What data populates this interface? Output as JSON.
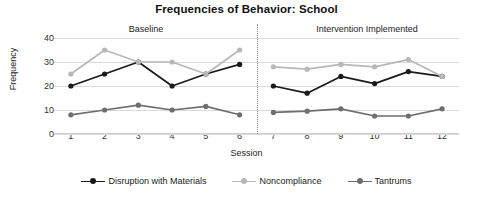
{
  "chart_data": {
    "type": "line",
    "title": "Frequencies of Behavior: School",
    "xlabel": "Session",
    "ylabel": "Frequency",
    "x": [
      1,
      2,
      3,
      4,
      5,
      6,
      7,
      8,
      9,
      10,
      11,
      12
    ],
    "xtick_labels": [
      "1",
      "2",
      "3",
      "4",
      "5",
      "6",
      "7",
      "8",
      "9",
      "10",
      "11",
      "12"
    ],
    "ytick_labels": [
      "0",
      "10",
      "20",
      "30",
      "40"
    ],
    "yticks": [
      0,
      10,
      20,
      30,
      40
    ],
    "ylim": [
      0,
      40
    ],
    "xlim": [
      0.5,
      12.5
    ],
    "grid": true,
    "legend_position": "bottom",
    "phase_change_after_x": 6,
    "series": [
      {
        "name": "Disruption with Materials",
        "color": "#1a1a1a",
        "values": [
          20,
          25,
          30,
          20,
          25,
          29,
          20,
          17,
          24,
          21,
          26,
          24
        ]
      },
      {
        "name": "Noncompliance",
        "color": "#b8b8b8",
        "values": [
          25,
          35,
          30,
          30,
          25,
          35,
          28,
          27,
          29,
          28,
          31,
          24
        ]
      },
      {
        "name": "Tantrums",
        "color": "#6e6e6e",
        "values": [
          8,
          10,
          12,
          10,
          11.5,
          8,
          9,
          9.5,
          10.5,
          7.5,
          7.5,
          10.5
        ]
      }
    ],
    "annotations": [
      {
        "name": "baseline",
        "text": "Baseline"
      },
      {
        "name": "intervention",
        "text": "Intervention Implemented"
      }
    ]
  }
}
